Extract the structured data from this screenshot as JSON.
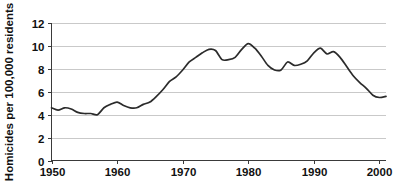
{
  "chart_data": {
    "type": "line",
    "title": "",
    "subtitle": "",
    "xlabel": "",
    "ylabel": "Homicides per 100,000 residents",
    "xlim": [
      1950,
      2001
    ],
    "ylim": [
      0,
      12
    ],
    "grid": true,
    "legend": null,
    "legend_position": "none",
    "y_ticks": [
      0,
      2,
      4,
      6,
      8,
      10,
      12
    ],
    "y_tick_labels": [
      "0",
      "2",
      "4",
      "6",
      "8",
      "10",
      "12"
    ],
    "x_ticks": [
      1950,
      1960,
      1970,
      1980,
      1990,
      2000
    ],
    "x_tick_labels": [
      "1950",
      "1960",
      "1970",
      "1980",
      "1990",
      "2000"
    ],
    "line_color": "#2b2b2b",
    "grid_color": "#c9c9c9",
    "axis_color": "#3a3a3a",
    "background_color": "#ffffff",
    "series": [
      {
        "name": "Homicide rate",
        "x": [
          1950,
          1951,
          1952,
          1953,
          1954,
          1955,
          1956,
          1957,
          1958,
          1959,
          1960,
          1961,
          1962,
          1963,
          1964,
          1965,
          1966,
          1967,
          1968,
          1969,
          1970,
          1971,
          1972,
          1973,
          1974,
          1975,
          1976,
          1977,
          1978,
          1979,
          1980,
          1981,
          1982,
          1983,
          1984,
          1985,
          1986,
          1987,
          1988,
          1989,
          1990,
          1991,
          1992,
          1993,
          1994,
          1995,
          1996,
          1997,
          1998,
          1999,
          2000,
          2001
        ],
        "values": [
          4.6,
          4.4,
          4.6,
          4.5,
          4.2,
          4.1,
          4.1,
          4.0,
          4.6,
          4.9,
          5.1,
          4.8,
          4.6,
          4.6,
          4.9,
          5.1,
          5.6,
          6.2,
          6.9,
          7.3,
          7.9,
          8.6,
          9.0,
          9.4,
          9.7,
          9.6,
          8.8,
          8.8,
          9.0,
          9.7,
          10.2,
          9.8,
          9.1,
          8.3,
          7.9,
          7.9,
          8.6,
          8.3,
          8.4,
          8.7,
          9.4,
          9.8,
          9.3,
          9.5,
          9.0,
          8.2,
          7.4,
          6.8,
          6.3,
          5.7,
          5.5,
          5.6
        ]
      }
    ]
  },
  "figure": {
    "y_axis_title": "Homicides per 100,000 residents"
  }
}
